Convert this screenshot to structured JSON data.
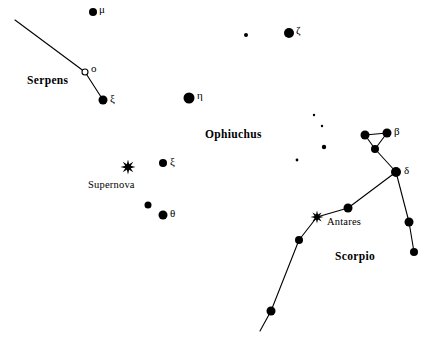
{
  "chart_data": {
    "type": "scatter",
    "title": "",
    "subtitle": "",
    "xlabel": "",
    "ylabel": "",
    "grid": false,
    "legend": "none",
    "background_color": "#ffffff",
    "ink_color": "#000000",
    "canvas": {
      "width": 431,
      "height": 342
    },
    "constellation_labels": [
      {
        "name": "Serpens",
        "x": 27,
        "y": 75
      },
      {
        "name": "Ophiuchus",
        "x": 205,
        "y": 129
      },
      {
        "name": "Scorpio",
        "x": 335,
        "y": 251
      }
    ],
    "named_star_labels": [
      {
        "name": "Supernova",
        "x": 88,
        "y": 180
      },
      {
        "name": "Antares",
        "x": 327,
        "y": 217
      }
    ],
    "stars": [
      {
        "id": "mu-oph",
        "label": "μ",
        "x": 93,
        "y": 12,
        "r": 4.0,
        "filled": true,
        "label_dx": 6,
        "label_dy": -8
      },
      {
        "id": "faint-a",
        "label": "",
        "x": 246,
        "y": 35,
        "r": 2.0,
        "filled": true,
        "label_dx": 0,
        "label_dy": 0
      },
      {
        "id": "zeta-oph",
        "label": "ζ",
        "x": 289,
        "y": 33,
        "r": 5.0,
        "filled": true,
        "label_dx": 7,
        "label_dy": -8
      },
      {
        "id": "omicron-ser",
        "label": "ο",
        "x": 85,
        "y": 72,
        "r": 3.0,
        "filled": false,
        "label_dx": 6,
        "label_dy": -9
      },
      {
        "id": "xi-ser",
        "label": "ξ",
        "x": 103,
        "y": 100,
        "r": 4.5,
        "filled": true,
        "label_dx": 7,
        "label_dy": -7
      },
      {
        "id": "eta-oph",
        "label": "η",
        "x": 189,
        "y": 98,
        "r": 5.5,
        "filled": true,
        "label_dx": 8,
        "label_dy": -8
      },
      {
        "id": "faint-b",
        "label": "",
        "x": 314,
        "y": 115,
        "r": 1.2,
        "filled": true,
        "label_dx": 0,
        "label_dy": 0
      },
      {
        "id": "faint-c",
        "label": "",
        "x": 322,
        "y": 126,
        "r": 1.2,
        "filled": true,
        "label_dx": 0,
        "label_dy": 0
      },
      {
        "id": "faint-d",
        "label": "",
        "x": 324,
        "y": 147,
        "r": 2.2,
        "filled": true,
        "label_dx": 0,
        "label_dy": 0
      },
      {
        "id": "faint-e",
        "label": "",
        "x": 297,
        "y": 160,
        "r": 1.4,
        "filled": true,
        "label_dx": 0,
        "label_dy": 0
      },
      {
        "id": "xi-oph",
        "label": "ξ",
        "x": 163,
        "y": 163,
        "r": 4.0,
        "filled": true,
        "label_dx": 7,
        "label_dy": -7
      },
      {
        "id": "theta-up",
        "label": "",
        "x": 148,
        "y": 205,
        "r": 3.5,
        "filled": true,
        "label_dx": 0,
        "label_dy": 0
      },
      {
        "id": "theta-oph",
        "label": "θ",
        "x": 163,
        "y": 215,
        "r": 4.5,
        "filled": true,
        "label_dx": 7,
        "label_dy": -7
      },
      {
        "id": "beta-sco-w",
        "label": "",
        "x": 365,
        "y": 135,
        "r": 4.5,
        "filled": true,
        "label_dx": 0,
        "label_dy": 0
      },
      {
        "id": "beta-sco",
        "label": "β",
        "x": 387,
        "y": 133,
        "r": 4.5,
        "filled": true,
        "label_dx": 7,
        "label_dy": -7
      },
      {
        "id": "beta-sco-s",
        "label": "",
        "x": 375,
        "y": 149,
        "r": 4.0,
        "filled": true,
        "label_dx": 0,
        "label_dy": 0
      },
      {
        "id": "delta-sco",
        "label": "δ",
        "x": 396,
        "y": 172,
        "r": 5.0,
        "filled": true,
        "label_dx": 8,
        "label_dy": -7
      },
      {
        "id": "branch-mid",
        "label": "",
        "x": 409,
        "y": 222,
        "r": 4.5,
        "filled": true,
        "label_dx": 0,
        "label_dy": 0
      },
      {
        "id": "branch-end",
        "label": "",
        "x": 414,
        "y": 252,
        "r": 4.0,
        "filled": true,
        "label_dx": 0,
        "label_dy": 0
      },
      {
        "id": "sigma-sco",
        "label": "",
        "x": 348,
        "y": 208,
        "r": 4.5,
        "filled": true,
        "label_dx": 0,
        "label_dy": 0
      },
      {
        "id": "tail-a",
        "label": "",
        "x": 299,
        "y": 240,
        "r": 4.0,
        "filled": true,
        "label_dx": 0,
        "label_dy": 0
      },
      {
        "id": "tail-b",
        "label": "",
        "x": 271,
        "y": 311,
        "r": 4.5,
        "filled": true,
        "label_dx": 0,
        "label_dy": 0
      }
    ],
    "special_markers": [
      {
        "id": "supernova-marker",
        "glyph": "star-burst",
        "x": 128,
        "y": 167,
        "size": 7.5,
        "name": "Supernova"
      },
      {
        "id": "antares-marker",
        "glyph": "star-burst",
        "x": 317,
        "y": 217,
        "size": 6.5,
        "name": "Antares"
      }
    ],
    "constellation_lines": [
      {
        "id": "serpens-chain",
        "points": [
          [
            15,
            20
          ],
          [
            85,
            72
          ],
          [
            103,
            100
          ]
        ]
      },
      {
        "id": "scorpio-beta-triangle",
        "points": [
          [
            365,
            135
          ],
          [
            387,
            133
          ],
          [
            375,
            149
          ],
          [
            365,
            135
          ]
        ]
      },
      {
        "id": "scorpio-beta-to-delta",
        "points": [
          [
            375,
            149
          ],
          [
            396,
            172
          ]
        ]
      },
      {
        "id": "scorpio-delta-branch",
        "points": [
          [
            396,
            172
          ],
          [
            409,
            222
          ],
          [
            414,
            252
          ]
        ]
      },
      {
        "id": "scorpio-body-tail",
        "points": [
          [
            396,
            172
          ],
          [
            348,
            208
          ],
          [
            317,
            217
          ],
          [
            299,
            240
          ],
          [
            271,
            311
          ],
          [
            260,
            331
          ]
        ]
      }
    ]
  }
}
